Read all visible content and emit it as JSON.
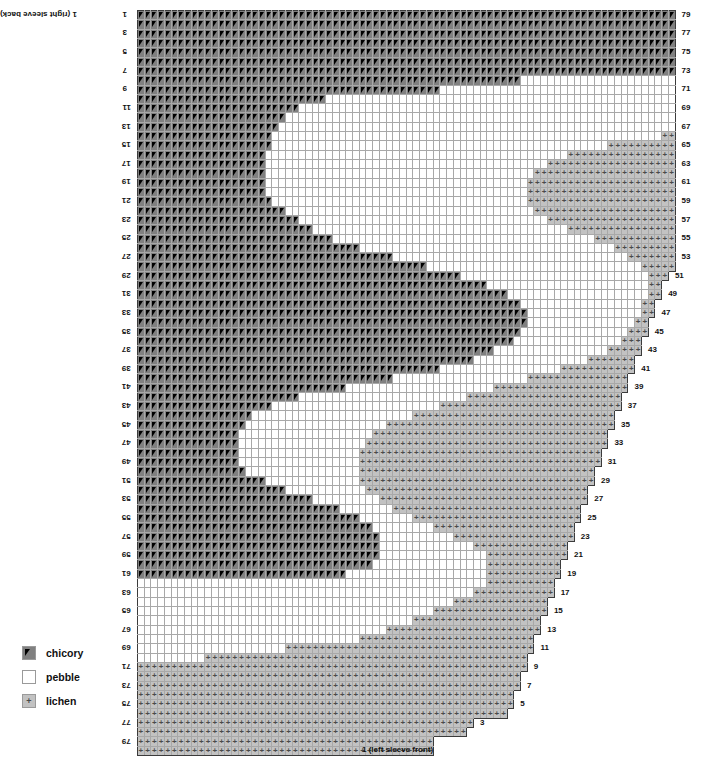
{
  "chart": {
    "title_top_left": "1 (right sleeve back)",
    "title_bottom_right": "1 (left sleeve front)",
    "columns": 80,
    "rows": 80,
    "cell_width_px": 6.72,
    "cell_height_px": 9.32,
    "major_gridline_every": 10,
    "grid_origin": {
      "x": 137,
      "y": 10
    },
    "colors": {
      "chicory": "#808080",
      "pebble": "#ffffff",
      "lichen": "#c2c2c2",
      "gridline_minor": "#a8a8a8",
      "gridline_major": "#3b3b3b",
      "symbol": "#000000",
      "background": "#ffffff"
    },
    "left_row_labels": [
      "1",
      "3",
      "5",
      "7",
      "9",
      "11",
      "13",
      "15",
      "17",
      "19",
      "21",
      "23",
      "25",
      "27",
      "29",
      "31",
      "33",
      "35",
      "37",
      "39",
      "41",
      "43",
      "45",
      "47",
      "49",
      "51",
      "53",
      "55",
      "57",
      "59",
      "61",
      "63",
      "65",
      "67",
      "69",
      "71",
      "73",
      "75",
      "77",
      "79"
    ],
    "right_row_labels": [
      "79",
      "77",
      "75",
      "73",
      "71",
      "69",
      "67",
      "65",
      "63",
      "61",
      "59",
      "57",
      "55",
      "53",
      "51",
      "49",
      "47",
      "45",
      "43",
      "41",
      "39",
      "37",
      "35",
      "33",
      "31",
      "29",
      "27",
      "25",
      "23",
      "21",
      "19",
      "17",
      "15",
      "13",
      "11",
      "9",
      "7",
      "5",
      "3"
    ],
    "legend": {
      "items": [
        {
          "symbol": "triangle-icon",
          "key": "chicory",
          "label": "chicory",
          "color": "#808080"
        },
        {
          "symbol": "blank-icon",
          "key": "pebble",
          "label": "pebble",
          "color": "#ffffff"
        },
        {
          "symbol": "plus-icon",
          "key": "lichen",
          "label": "lichen",
          "color": "#c2c2c2"
        }
      ]
    },
    "pattern": {
      "note": "Per-row spans. chicory_end = number of leading chicory columns (0-based exclusive). lichen_start = first lichen column. row_end = last drawn column+1 (staircase right edge).",
      "rows": [
        {
          "r": 0,
          "chicory_end": 80,
          "lichen_start": 80,
          "row_end": 80
        },
        {
          "r": 1,
          "chicory_end": 80,
          "lichen_start": 80,
          "row_end": 80
        },
        {
          "r": 2,
          "chicory_end": 80,
          "lichen_start": 80,
          "row_end": 80
        },
        {
          "r": 3,
          "chicory_end": 80,
          "lichen_start": 80,
          "row_end": 80
        },
        {
          "r": 4,
          "chicory_end": 80,
          "lichen_start": 80,
          "row_end": 80
        },
        {
          "r": 5,
          "chicory_end": 80,
          "lichen_start": 80,
          "row_end": 80
        },
        {
          "r": 6,
          "chicory_end": 80,
          "lichen_start": 80,
          "row_end": 80
        },
        {
          "r": 7,
          "chicory_end": 57,
          "lichen_start": 80,
          "row_end": 80
        },
        {
          "r": 8,
          "chicory_end": 45,
          "lichen_start": 80,
          "row_end": 80
        },
        {
          "r": 9,
          "chicory_end": 28,
          "lichen_start": 80,
          "row_end": 80
        },
        {
          "r": 10,
          "chicory_end": 24,
          "lichen_start": 80,
          "row_end": 80
        },
        {
          "r": 11,
          "chicory_end": 22,
          "lichen_start": 80,
          "row_end": 80
        },
        {
          "r": 12,
          "chicory_end": 21,
          "lichen_start": 80,
          "row_end": 80
        },
        {
          "r": 13,
          "chicory_end": 20,
          "lichen_start": 78,
          "row_end": 80
        },
        {
          "r": 14,
          "chicory_end": 20,
          "lichen_start": 70,
          "row_end": 80
        },
        {
          "r": 15,
          "chicory_end": 19,
          "lichen_start": 64,
          "row_end": 80
        },
        {
          "r": 16,
          "chicory_end": 19,
          "lichen_start": 61,
          "row_end": 80
        },
        {
          "r": 17,
          "chicory_end": 19,
          "lichen_start": 59,
          "row_end": 80
        },
        {
          "r": 18,
          "chicory_end": 19,
          "lichen_start": 58,
          "row_end": 80
        },
        {
          "r": 19,
          "chicory_end": 19,
          "lichen_start": 58,
          "row_end": 80
        },
        {
          "r": 20,
          "chicory_end": 20,
          "lichen_start": 58,
          "row_end": 80
        },
        {
          "r": 21,
          "chicory_end": 22,
          "lichen_start": 59,
          "row_end": 80
        },
        {
          "r": 22,
          "chicory_end": 24,
          "lichen_start": 61,
          "row_end": 80
        },
        {
          "r": 23,
          "chicory_end": 26,
          "lichen_start": 64,
          "row_end": 80
        },
        {
          "r": 24,
          "chicory_end": 29,
          "lichen_start": 68,
          "row_end": 80
        },
        {
          "r": 25,
          "chicory_end": 33,
          "lichen_start": 71,
          "row_end": 80
        },
        {
          "r": 26,
          "chicory_end": 38,
          "lichen_start": 73,
          "row_end": 80
        },
        {
          "r": 27,
          "chicory_end": 43,
          "lichen_start": 75,
          "row_end": 80
        },
        {
          "r": 28,
          "chicory_end": 48,
          "lichen_start": 76,
          "row_end": 79
        },
        {
          "r": 29,
          "chicory_end": 52,
          "lichen_start": 76,
          "row_end": 78
        },
        {
          "r": 30,
          "chicory_end": 55,
          "lichen_start": 76,
          "row_end": 78
        },
        {
          "r": 31,
          "chicory_end": 57,
          "lichen_start": 75,
          "row_end": 77
        },
        {
          "r": 32,
          "chicory_end": 58,
          "lichen_start": 75,
          "row_end": 77
        },
        {
          "r": 33,
          "chicory_end": 58,
          "lichen_start": 74,
          "row_end": 76
        },
        {
          "r": 34,
          "chicory_end": 57,
          "lichen_start": 73,
          "row_end": 76
        },
        {
          "r": 35,
          "chicory_end": 56,
          "lichen_start": 72,
          "row_end": 75
        },
        {
          "r": 36,
          "chicory_end": 53,
          "lichen_start": 70,
          "row_end": 75
        },
        {
          "r": 37,
          "chicory_end": 50,
          "lichen_start": 67,
          "row_end": 74
        },
        {
          "r": 38,
          "chicory_end": 45,
          "lichen_start": 63,
          "row_end": 74
        },
        {
          "r": 39,
          "chicory_end": 38,
          "lichen_start": 58,
          "row_end": 73
        },
        {
          "r": 40,
          "chicory_end": 31,
          "lichen_start": 53,
          "row_end": 73
        },
        {
          "r": 41,
          "chicory_end": 24,
          "lichen_start": 49,
          "row_end": 72
        },
        {
          "r": 42,
          "chicory_end": 20,
          "lichen_start": 45,
          "row_end": 72
        },
        {
          "r": 43,
          "chicory_end": 17,
          "lichen_start": 41,
          "row_end": 71
        },
        {
          "r": 44,
          "chicory_end": 16,
          "lichen_start": 37,
          "row_end": 71
        },
        {
          "r": 45,
          "chicory_end": 15,
          "lichen_start": 35,
          "row_end": 70
        },
        {
          "r": 46,
          "chicory_end": 15,
          "lichen_start": 34,
          "row_end": 70
        },
        {
          "r": 47,
          "chicory_end": 15,
          "lichen_start": 33,
          "row_end": 69
        },
        {
          "r": 48,
          "chicory_end": 15,
          "lichen_start": 33,
          "row_end": 69
        },
        {
          "r": 49,
          "chicory_end": 16,
          "lichen_start": 33,
          "row_end": 68
        },
        {
          "r": 50,
          "chicory_end": 19,
          "lichen_start": 33,
          "row_end": 68
        },
        {
          "r": 51,
          "chicory_end": 22,
          "lichen_start": 34,
          "row_end": 67
        },
        {
          "r": 52,
          "chicory_end": 26,
          "lichen_start": 36,
          "row_end": 67
        },
        {
          "r": 53,
          "chicory_end": 30,
          "lichen_start": 38,
          "row_end": 66
        },
        {
          "r": 54,
          "chicory_end": 33,
          "lichen_start": 41,
          "row_end": 66
        },
        {
          "r": 55,
          "chicory_end": 35,
          "lichen_start": 44,
          "row_end": 65
        },
        {
          "r": 56,
          "chicory_end": 36,
          "lichen_start": 47,
          "row_end": 65
        },
        {
          "r": 57,
          "chicory_end": 36,
          "lichen_start": 50,
          "row_end": 64
        },
        {
          "r": 58,
          "chicory_end": 36,
          "lichen_start": 52,
          "row_end": 64
        },
        {
          "r": 59,
          "chicory_end": 35,
          "lichen_start": 52,
          "row_end": 63
        },
        {
          "r": 60,
          "chicory_end": 31,
          "lichen_start": 52,
          "row_end": 63
        },
        {
          "r": 61,
          "chicory_end": 0,
          "lichen_start": 52,
          "row_end": 62
        },
        {
          "r": 62,
          "chicory_end": 0,
          "lichen_start": 50,
          "row_end": 62
        },
        {
          "r": 63,
          "chicory_end": 0,
          "lichen_start": 47,
          "row_end": 61
        },
        {
          "r": 64,
          "chicory_end": 0,
          "lichen_start": 44,
          "row_end": 61
        },
        {
          "r": 65,
          "chicory_end": 0,
          "lichen_start": 41,
          "row_end": 60
        },
        {
          "r": 66,
          "chicory_end": 0,
          "lichen_start": 37,
          "row_end": 60
        },
        {
          "r": 67,
          "chicory_end": 0,
          "lichen_start": 33,
          "row_end": 59
        },
        {
          "r": 68,
          "chicory_end": 0,
          "lichen_start": 22,
          "row_end": 59
        },
        {
          "r": 69,
          "chicory_end": 0,
          "lichen_start": 10,
          "row_end": 58
        },
        {
          "r": 70,
          "chicory_end": 0,
          "lichen_start": 0,
          "row_end": 58
        },
        {
          "r": 71,
          "chicory_end": 0,
          "lichen_start": 0,
          "row_end": 57
        },
        {
          "r": 72,
          "chicory_end": 0,
          "lichen_start": 0,
          "row_end": 57
        },
        {
          "r": 73,
          "chicory_end": 0,
          "lichen_start": 0,
          "row_end": 56
        },
        {
          "r": 74,
          "chicory_end": 0,
          "lichen_start": 0,
          "row_end": 56
        },
        {
          "r": 75,
          "chicory_end": 0,
          "lichen_start": 0,
          "row_end": 55
        },
        {
          "r": 76,
          "chicory_end": 0,
          "lichen_start": 0,
          "row_end": 50
        },
        {
          "r": 77,
          "chicory_end": 0,
          "lichen_start": 0,
          "row_end": 49
        },
        {
          "r": 78,
          "chicory_end": 0,
          "lichen_start": 0,
          "row_end": 44
        },
        {
          "r": 79,
          "chicory_end": 0,
          "lichen_start": 0,
          "row_end": 44
        }
      ]
    }
  }
}
